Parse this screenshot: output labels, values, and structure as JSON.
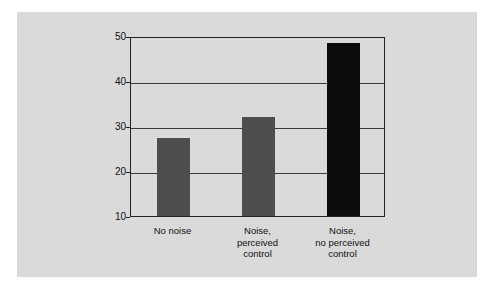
{
  "figure": {
    "background_color": "#ffffff",
    "panel_color": "#dcdcdc"
  },
  "chart_data": {
    "type": "bar",
    "title": "",
    "xlabel": "",
    "ylabel": "Percentage of errors in problem solving",
    "categories": [
      "No noise",
      "Noise,\nperceived\ncontrol",
      "Noise,\nno perceived\ncontrol"
    ],
    "category_lines": [
      [
        "No noise"
      ],
      [
        "Noise,",
        "perceived",
        "control"
      ],
      [
        "Noise,",
        "no perceived",
        "control"
      ]
    ],
    "values": [
      27.3,
      32.0,
      48.5
    ],
    "bar_colors": [
      "#4d4d4d",
      "#4d4d4d",
      "#0b0b0b"
    ],
    "ylim": [
      10,
      50
    ],
    "yticks": [
      50,
      40,
      30,
      20,
      10
    ],
    "ytick_labels": [
      "50",
      "40",
      "30",
      "20",
      "10"
    ],
    "grid": true,
    "grid_axis": "y",
    "legend": null,
    "legend_position": "none"
  }
}
